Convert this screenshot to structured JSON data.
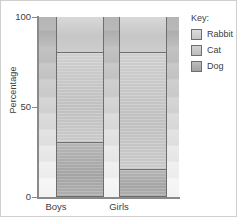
{
  "chart_data": {
    "type": "bar",
    "subtype": "stacked-percentage",
    "title": "",
    "xlabel": "",
    "ylabel": "Percentage",
    "categories": [
      "Boys",
      "Girls"
    ],
    "ylim": [
      0,
      100
    ],
    "yticks": [
      0,
      50,
      100
    ],
    "ytick_labels": [
      "0",
      "50",
      "100"
    ],
    "grid": false,
    "legend_position": "right",
    "legend_title": "Key:",
    "series": [
      {
        "name": "Dog",
        "values": [
          30,
          15
        ],
        "color": "#aeaeae"
      },
      {
        "name": "Cat",
        "values": [
          50,
          65
        ],
        "color": "#c6c6c6"
      },
      {
        "name": "Rabbit",
        "values": [
          20,
          20
        ],
        "color": "#d2d2d2"
      }
    ],
    "segments": {
      "Boys": [
        {
          "name": "Dog",
          "start": 0,
          "end": 30,
          "value": 30
        },
        {
          "name": "Cat",
          "start": 30,
          "end": 80,
          "value": 50
        },
        {
          "name": "Rabbit",
          "start": 80,
          "end": 100,
          "value": 20
        }
      ],
      "Girls": [
        {
          "name": "Dog",
          "start": 0,
          "end": 15,
          "value": 15
        },
        {
          "name": "Cat",
          "start": 15,
          "end": 80,
          "value": 65
        },
        {
          "name": "Rabbit",
          "start": 80,
          "end": 100,
          "value": 20
        }
      ]
    }
  },
  "axis": {
    "ylabel": "Percentage",
    "ytick_100": "100",
    "ytick_50": "50",
    "ytick_0": "0",
    "xtick_boys": "Boys",
    "xtick_girls": "Girls"
  },
  "legend": {
    "title": "Key:",
    "items": [
      {
        "label": "Rabbit",
        "color": "#d2d2d2"
      },
      {
        "label": "Cat",
        "color": "#c6c6c6"
      },
      {
        "label": "Dog",
        "color": "#aeaeae"
      }
    ]
  }
}
